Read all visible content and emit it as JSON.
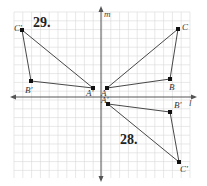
{
  "figure": {
    "grid": {
      "x0": 14,
      "y0": 12,
      "x1": 190,
      "y1": 178,
      "step": 8.8,
      "color": "#d9d9d9"
    },
    "axes": {
      "vertical": {
        "label": "m",
        "x": 101,
        "y_top": 8,
        "y_bottom": 180
      },
      "horizontal": {
        "label": "l",
        "y": 97,
        "x_left": 12,
        "x_right": 195
      },
      "color": "#555555"
    },
    "exercise_labels": [
      {
        "text": "29.",
        "x": 33,
        "y": 27
      },
      {
        "text": "28.",
        "x": 120,
        "y": 144
      }
    ],
    "triangles": [
      {
        "name": "triangle-29-image",
        "vertices": [
          {
            "label": "C'",
            "x": 22,
            "y": 30,
            "lx": 14,
            "ly": 31
          },
          {
            "label": "B'",
            "x": 31,
            "y": 81,
            "lx": 25,
            "ly": 93
          },
          {
            "label": "A'",
            "x": 93,
            "y": 88,
            "lx": 86,
            "ly": 96
          }
        ]
      },
      {
        "name": "triangle-original",
        "vertices": [
          {
            "label": "A",
            "x": 107,
            "y": 88,
            "lx": 101,
            "ly": 96
          },
          {
            "label": "B",
            "x": 170,
            "y": 79,
            "lx": 169,
            "ly": 90
          },
          {
            "label": "C",
            "x": 178,
            "y": 29,
            "lx": 182,
            "ly": 30
          }
        ]
      },
      {
        "name": "triangle-28-image",
        "vertices": [
          {
            "label": "A'",
            "x": 108,
            "y": 104,
            "lx": 101,
            "ly": 103
          },
          {
            "label": "B'",
            "x": 170,
            "y": 112,
            "lx": 174,
            "ly": 108
          },
          {
            "label": "C'",
            "x": 179,
            "y": 162,
            "lx": 180,
            "ly": 172
          }
        ]
      }
    ],
    "line_color": "#333333",
    "point_color": "#111111"
  }
}
